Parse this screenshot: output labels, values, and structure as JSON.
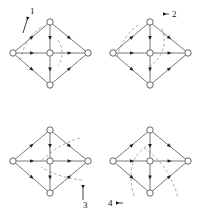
{
  "figure": {
    "background_color": "#ffffff",
    "line_color": "#555555",
    "arrow_color": "#222222",
    "node_fill": "#ffffff",
    "node_stroke": "#555555",
    "dash_color": "#888888",
    "label_color": "#111111",
    "panel_count": 4
  },
  "geometry": {
    "panel_width": 100,
    "panel_height": 108,
    "top": {
      "x": 50,
      "y": 22
    },
    "bottom": {
      "x": 50,
      "y": 85
    },
    "left": {
      "x": 13,
      "y": 53
    },
    "right": {
      "x": 88,
      "y": 53
    },
    "center": {
      "x": 50,
      "y": 53
    },
    "node_radius": 3.2,
    "arrow_size": 2.6
  },
  "panels": [
    {
      "id": "panel-1",
      "label": "1",
      "label_position": "top-left",
      "label_x": 30,
      "label_y": 14,
      "leader": {
        "from_x": 28,
        "from_y": 17,
        "to_x": 23,
        "to_y": 33
      },
      "arcs": [
        {
          "name": "arc-upper-left",
          "d": "M 20 60 Q 27 34 44 26"
        },
        {
          "name": "arc-center-right",
          "d": "M 58 40 Q 66 53 58 66"
        }
      ]
    },
    {
      "id": "panel-2",
      "label": "2",
      "label_position": "top-right",
      "label_x": 72,
      "label_y": 17,
      "leader": {
        "from_x": 63,
        "from_y": 14,
        "to_x": 69,
        "to_y": 14
      },
      "arcs": [
        {
          "name": "arc-upper-left",
          "d": "M 17 57 Q 24 33 40 24"
        },
        {
          "name": "arc-center-sweep",
          "d": "M 62 28 Q 70 53 48 68"
        }
      ]
    },
    {
      "id": "panel-3",
      "label": "3",
      "label_position": "bottom-right",
      "label_x": 83,
      "label_y": 100,
      "leader": {
        "from_x": 83,
        "from_y": 77,
        "to_x": 83,
        "to_y": 92
      },
      "arcs": [
        {
          "name": "arc-upper-right",
          "d": "M 80 30 Q 58 36 40 54"
        },
        {
          "name": "arc-lower-right",
          "d": "M 82 72 Q 60 70 41 59"
        }
      ]
    },
    {
      "id": "panel-4",
      "label": "4",
      "label_position": "bottom-left",
      "label_x": 8,
      "label_y": 98,
      "leader": {
        "from_x": 16,
        "from_y": 95,
        "to_x": 23,
        "to_y": 95
      },
      "arcs": [
        {
          "name": "arc-center-loop",
          "d": "M 34 88 Q 24 52 47 38"
        },
        {
          "name": "arc-right-lower",
          "d": "M 44 40 Q 70 58 78 90"
        }
      ]
    }
  ],
  "edges": [
    {
      "name": "edge-left-to-top",
      "from": "left",
      "to": "top",
      "arrow": "forward"
    },
    {
      "name": "edge-top-to-right",
      "from": "top",
      "to": "right",
      "arrow": "forward"
    },
    {
      "name": "edge-left-to-bottom",
      "from": "left",
      "to": "bottom",
      "arrow": "forward"
    },
    {
      "name": "edge-bottom-to-right",
      "from": "bottom",
      "to": "right",
      "arrow": "forward"
    },
    {
      "name": "edge-left-to-center",
      "from": "left",
      "to": "center",
      "arrow": "forward"
    },
    {
      "name": "edge-center-to-right",
      "from": "center",
      "to": "right",
      "arrow": "forward"
    },
    {
      "name": "edge-top-to-center",
      "from": "top",
      "to": "center",
      "arrow": "forward"
    },
    {
      "name": "edge-center-to-bottom",
      "from": "center",
      "to": "bottom",
      "arrow": "forward"
    }
  ],
  "nodes": [
    {
      "name": "node-top",
      "key": "top"
    },
    {
      "name": "node-right",
      "key": "right"
    },
    {
      "name": "node-bottom",
      "key": "bottom"
    },
    {
      "name": "node-left",
      "key": "left"
    },
    {
      "name": "node-center",
      "key": "center"
    }
  ]
}
